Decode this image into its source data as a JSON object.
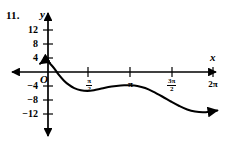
{
  "figure": {
    "problem_number": "11.",
    "x_axis_label": "x",
    "y_axis_label": "y",
    "origin_label": "O",
    "ink_color": "#000000",
    "background_color": "#ffffff"
  },
  "chart_data": {
    "type": "line",
    "title": "",
    "xlabel": "x",
    "ylabel": "y",
    "grid": false,
    "legend": "none",
    "xlim": [
      -0.35,
      6.6
    ],
    "ylim": [
      -14,
      14
    ],
    "x_ticks": [
      {
        "value": 1.5708,
        "label_num": "π",
        "label_den": "2",
        "label_coef": "",
        "kind": "fraction"
      },
      {
        "value": 3.1416,
        "label_num": "",
        "label_den": "",
        "label_coef": "π",
        "kind": "plain"
      },
      {
        "value": 4.7124,
        "label_num": "3π",
        "label_den": "2",
        "label_coef": "",
        "kind": "fraction"
      },
      {
        "value": 6.2832,
        "label_num": "",
        "label_den": "",
        "label_coef": "2π",
        "kind": "plain"
      }
    ],
    "y_ticks": [
      {
        "value": 12,
        "label": "12"
      },
      {
        "value": 8,
        "label": "8"
      },
      {
        "value": 4,
        "label": "4"
      },
      {
        "value": -4,
        "label": "−4"
      },
      {
        "value": -8,
        "label": "−8"
      },
      {
        "value": -12,
        "label": "−12"
      }
    ],
    "series": [
      {
        "name": "curve",
        "arrow_start": true,
        "arrow_end": true,
        "points": [
          [
            -0.3,
            2.4
          ],
          [
            -0.2,
            2.9
          ],
          [
            -0.1,
            3.1
          ],
          [
            0.0,
            2.9
          ],
          [
            0.1,
            2.2
          ],
          [
            0.25,
            0.9
          ],
          [
            0.4,
            -0.7
          ],
          [
            0.6,
            -2.4
          ],
          [
            0.8,
            -3.7
          ],
          [
            1.0,
            -4.6
          ],
          [
            1.25,
            -5.2
          ],
          [
            1.5,
            -5.4
          ],
          [
            1.75,
            -5.2
          ],
          [
            2.0,
            -4.8
          ],
          [
            2.3,
            -4.3
          ],
          [
            2.6,
            -4.0
          ],
          [
            2.9,
            -3.8
          ],
          [
            3.15,
            -3.8
          ],
          [
            3.4,
            -4.0
          ],
          [
            3.7,
            -4.6
          ],
          [
            4.0,
            -5.6
          ],
          [
            4.35,
            -7.0
          ],
          [
            4.7,
            -8.5
          ],
          [
            5.0,
            -9.7
          ],
          [
            5.3,
            -10.7
          ],
          [
            5.6,
            -11.3
          ],
          [
            5.9,
            -11.5
          ],
          [
            6.2,
            -11.3
          ],
          [
            6.45,
            -11.0
          ]
        ]
      }
    ],
    "features": {
      "left_local_max": {
        "x": -0.1,
        "y": 3.1
      },
      "first_local_min": {
        "x": 1.5,
        "y": -5.4
      },
      "local_max": {
        "x": 3.05,
        "y": -3.8
      },
      "second_local_min": {
        "x": 5.9,
        "y": -11.5
      },
      "x_intercepts": [
        0.3
      ]
    }
  }
}
